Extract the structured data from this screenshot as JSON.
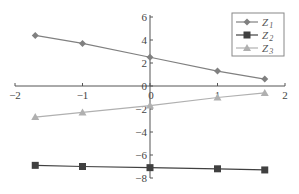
{
  "chart_data": {
    "type": "line",
    "title": "",
    "xlabel": "",
    "ylabel": "",
    "xlim": [
      -2,
      2
    ],
    "ylim": [
      -8,
      6
    ],
    "x_ticks": [
      -2,
      -1,
      0,
      1,
      2
    ],
    "y_ticks": [
      -8,
      -6,
      -4,
      -2,
      0,
      2,
      4,
      6
    ],
    "grid": false,
    "legend_position": "upper right",
    "x": [
      -1.7,
      -1,
      0,
      1,
      1.7
    ],
    "series": [
      {
        "name": "Z1",
        "label_main": "Z",
        "label_sub": "1",
        "marker": "diamond",
        "color": "#808080",
        "values": [
          4.4,
          3.7,
          2.5,
          1.3,
          0.6
        ]
      },
      {
        "name": "Z2",
        "label_main": "Z",
        "label_sub": "2",
        "marker": "square",
        "color": "#404040",
        "values": [
          -6.9,
          -7.0,
          -7.1,
          -7.2,
          -7.3
        ]
      },
      {
        "name": "Z3",
        "label_main": "Z",
        "label_sub": "3",
        "marker": "triangle",
        "color": "#b0b0b0",
        "values": [
          -2.7,
          -2.3,
          -1.7,
          -1.0,
          -0.6
        ]
      }
    ]
  },
  "axes": {
    "x_tick_labels": [
      "−2",
      "−1",
      "0",
      "1",
      "2"
    ],
    "y_tick_labels": [
      "−8",
      "−6",
      "−4",
      "−2",
      "0",
      "2",
      "4",
      "6"
    ]
  }
}
